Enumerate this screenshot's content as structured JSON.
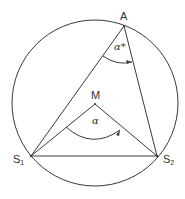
{
  "diagram": {
    "type": "inscribed-angle-theorem",
    "circle": {
      "cx": 95,
      "cy": 103,
      "r": 83
    },
    "points": {
      "A": {
        "label": "A",
        "x": 124,
        "y": 26
      },
      "M": {
        "label": "M",
        "x": 95,
        "y": 104
      },
      "S1": {
        "label": "S",
        "sub": "1",
        "x": 31,
        "y": 156
      },
      "S2": {
        "label": "S",
        "sub": "2",
        "x": 157,
        "y": 156
      }
    },
    "angles": {
      "inscribed": {
        "label": "α*",
        "vertex": "A"
      },
      "central": {
        "label": "α",
        "vertex": "M"
      }
    },
    "colors": {
      "stroke": "#3a3a3a",
      "text": "#333333",
      "background": "#ffffff"
    }
  }
}
